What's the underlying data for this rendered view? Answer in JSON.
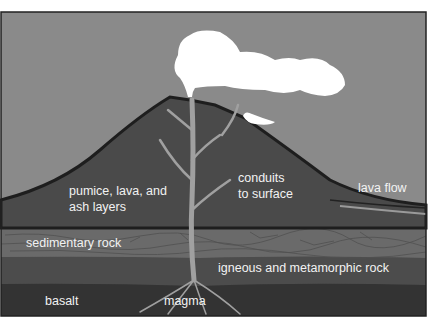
{
  "labels": {
    "pumice_line1": "pumice, lava, and",
    "pumice_line2": "ash layers",
    "conduits_line1": "conduits",
    "conduits_line2": "to surface",
    "lava_flow": "lava flow",
    "sedimentary": "sedimentary rock",
    "igneous": "igneous and metamorphic rock",
    "basalt": "basalt",
    "magma": "magma"
  },
  "colors": {
    "sky": "#8a8a8a",
    "volcano": "#4a4a4a",
    "outline": "#1e1e1e",
    "sedimentary": "#6a6a6a",
    "igneous": "#4c4c4c",
    "basalt": "#333333",
    "conduit": "#9a9a9a",
    "smoke": "#ffffff"
  }
}
